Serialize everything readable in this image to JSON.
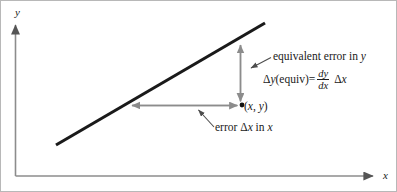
{
  "figure": {
    "type": "diagram",
    "axes": {
      "y_label": "y",
      "x_label": "x",
      "y_axis_arrow": "up",
      "x_axis_arrow": "right"
    },
    "point": {
      "label_open": "(",
      "label_x": "x",
      "label_comma": ", ",
      "label_y": "y",
      "label_close": ")",
      "label_full": "(x, y)"
    },
    "annotations": {
      "equivalent_error": "equivalent error in ",
      "equivalent_error_var": "y",
      "error_x_prefix": "error Δ",
      "error_x_var": "x",
      "error_x_middle": " in ",
      "error_x_var2": "x",
      "error_x_full": "error Δx in x"
    },
    "formula": {
      "lhs": "Δ",
      "lhs_var": "y",
      "lhs_paren": " (equiv)",
      "equals": " = ",
      "fraction_numerator": "dy",
      "fraction_denominator": "dx",
      "rhs_delta": "Δ",
      "rhs_var": "x",
      "full": "Δy (equiv) = dy/dx Δx"
    },
    "colors": {
      "line": "#1a1a1a",
      "axis": "#8c8c8c",
      "arrow": "#8c8c8c",
      "leader": "#4d4d4d",
      "text": "#1a1a1a",
      "background": "#ffffff",
      "border": "#b8b8b8"
    },
    "geometry": {
      "trend_line_start": [
        55,
        144
      ],
      "trend_line_end": [
        264,
        22
      ],
      "vertical_arrow_x": 239,
      "vertical_arrow_top_y": 41,
      "vertical_arrow_bottom_y": 103,
      "horizontal_arrow_y": 104,
      "horizontal_arrow_left_x": 127,
      "horizontal_arrow_right_x": 238,
      "point_xy": [
        240,
        104
      ]
    }
  }
}
